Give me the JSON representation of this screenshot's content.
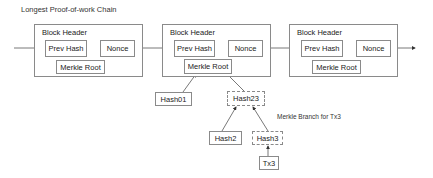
{
  "title": "Longest Proof-of-work Chain",
  "blocks": [
    {
      "header_label": "Block Header",
      "prev_hash": "Prev Hash",
      "nonce": "Nonce",
      "merkle_root": "Merkle Root"
    },
    {
      "header_label": "Block Header",
      "prev_hash": "Prev Hash",
      "nonce": "Nonce",
      "merkle_root": "Merkle Root"
    },
    {
      "header_label": "Block Header",
      "prev_hash": "Prev Hash",
      "nonce": "Nonce",
      "merkle_root": "Merkle Root"
    }
  ],
  "merkle_tree": {
    "hash01": "Hash01",
    "hash23": "Hash23",
    "hash2": "Hash2",
    "hash3": "Hash3",
    "tx3": "Tx3"
  },
  "annotation": "Merkle Branch for Tx3",
  "colors": {
    "line": "#8a8a8a",
    "arrow": "#333333",
    "text": "#222222"
  }
}
